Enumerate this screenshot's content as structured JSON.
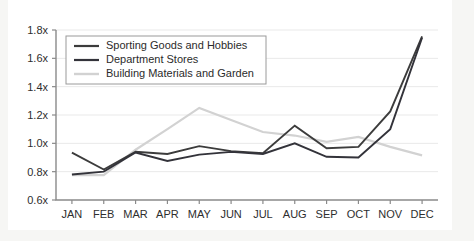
{
  "chart_data": {
    "type": "line",
    "title": "",
    "subtitle": "",
    "xlabel": "",
    "ylabel": "",
    "categories": [
      "JAN",
      "FEB",
      "MAR",
      "APR",
      "MAY",
      "JUN",
      "JUL",
      "AUG",
      "SEP",
      "OCT",
      "NOV",
      "DEC"
    ],
    "ytick_labels": [
      "1.8x",
      "1.6x",
      "1.4x",
      "1.2x",
      "1.0x",
      "0.8x",
      "0.6x"
    ],
    "ytick_values": [
      1.8,
      1.6,
      1.4,
      1.2,
      1.0,
      0.8,
      0.6
    ],
    "ylim": [
      0.6,
      1.8
    ],
    "grid": true,
    "legend_position": "top-left",
    "series": [
      {
        "name": "Sporting Goods and Hobbies",
        "color": "#3c3c3c",
        "values": [
          0.935,
          0.815,
          0.94,
          0.925,
          0.98,
          0.945,
          0.93,
          1.125,
          0.965,
          0.975,
          1.225,
          1.755
        ]
      },
      {
        "name": "Department Stores",
        "color": "#33333a",
        "values": [
          0.78,
          0.8,
          0.935,
          0.875,
          0.92,
          0.94,
          0.925,
          1.0,
          0.905,
          0.9,
          1.1,
          1.745
        ]
      },
      {
        "name": "Building Materials and Garden",
        "color": "#d2d2d2",
        "values": [
          0.775,
          0.775,
          0.955,
          1.1,
          1.25,
          1.165,
          1.08,
          1.055,
          1.01,
          1.045,
          0.975,
          0.915
        ]
      }
    ]
  },
  "legend": {
    "entries": [
      {
        "label": "Sporting Goods and Hobbies"
      },
      {
        "label": "Department Stores"
      },
      {
        "label": "Building Materials and Garden"
      }
    ]
  },
  "colors": {
    "page_background": "#f6f6f4",
    "card_background": "#ffffff",
    "gridline": "#e9e9e9",
    "axis": "#8a8a8a",
    "text": "#2e2e2e",
    "series_1": "#3c3c3c",
    "series_2": "#33333a",
    "series_3": "#d2d2d2"
  }
}
